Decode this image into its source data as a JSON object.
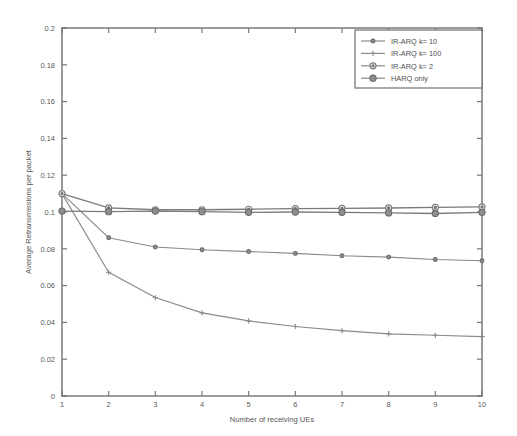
{
  "chart_data": {
    "type": "line",
    "title": "",
    "xlabel": "Number of receiving UEs",
    "ylabel": "Average Retransmissions per packet",
    "x": [
      1,
      2,
      3,
      4,
      5,
      6,
      7,
      8,
      9,
      10
    ],
    "xlim": [
      1,
      10
    ],
    "ylim": [
      0,
      0.2
    ],
    "xticks": [
      "1",
      "2",
      "3",
      "4",
      "5",
      "6",
      "7",
      "8",
      "9",
      "10"
    ],
    "yticks": [
      "0",
      "0.02",
      "0.04",
      "0.06",
      "0.08",
      "0.1",
      "0.12",
      "0.14",
      "0.16",
      "0.18",
      "0.2"
    ],
    "grid": false,
    "legend_position": "top-right",
    "series": [
      {
        "name": "IR-ARQ k= 10",
        "marker": "dot",
        "values": [
          0.11,
          0.086,
          0.081,
          0.0795,
          0.0785,
          0.0775,
          0.0762,
          0.0755,
          0.0742,
          0.0735
        ]
      },
      {
        "name": "IR-ARQ k= 100",
        "marker": "plus",
        "values": [
          0.11,
          0.0672,
          0.0535,
          0.0452,
          0.0408,
          0.0378,
          0.0355,
          0.0338,
          0.033,
          0.0323
        ]
      },
      {
        "name": "IR-ARQ k= 2",
        "marker": "circle",
        "values": [
          0.11,
          0.1022,
          0.1012,
          0.1012,
          0.1015,
          0.1018,
          0.102,
          0.1022,
          0.1025,
          0.1028
        ]
      },
      {
        "name": "HARQ only",
        "marker": "filled-circle",
        "values": [
          0.1005,
          0.1002,
          0.1005,
          0.1002,
          0.0998,
          0.1,
          0.0998,
          0.0995,
          0.0992,
          0.0998
        ]
      }
    ]
  },
  "legend": {
    "items": [
      {
        "label": "IR-ARQ k= 10"
      },
      {
        "label": "IR-ARQ k= 100"
      },
      {
        "label": "IR-ARQ k= 2"
      },
      {
        "label": "HARQ only"
      }
    ]
  },
  "colors": {
    "background": "#ffffff",
    "axis": "#6f6f6f",
    "series": "#8a8a8a",
    "text": "#4f4f4f"
  }
}
